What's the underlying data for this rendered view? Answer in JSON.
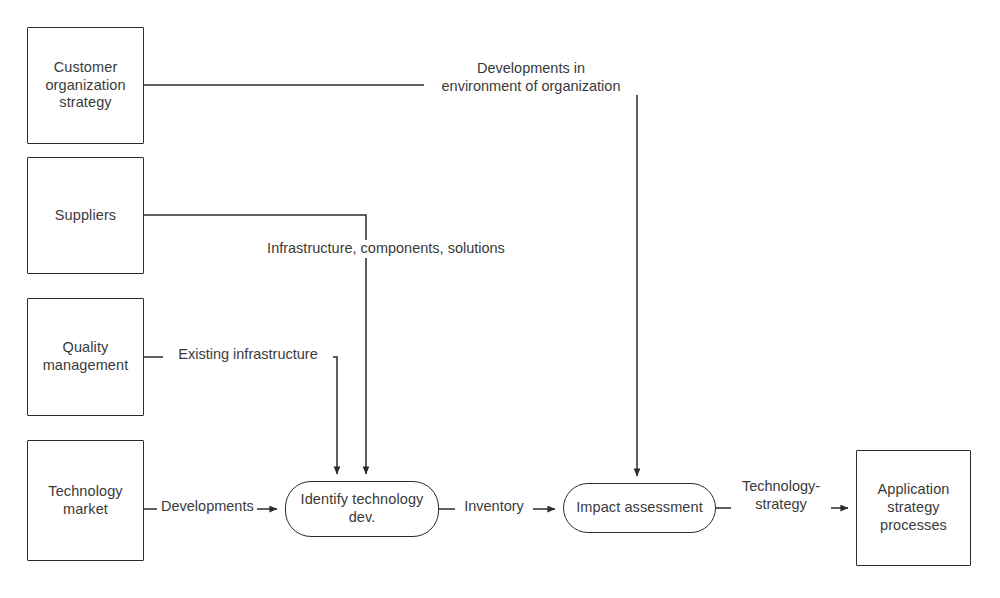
{
  "diagram": {
    "background_color": "#ffffff",
    "line_color": "#2b2b2b",
    "text_color": "#3a3a3a",
    "nodes": [
      {
        "id": "customer-organization-strategy",
        "label": "Customer\norganization\nstrategy",
        "shape": "rectangle"
      },
      {
        "id": "suppliers",
        "label": "Suppliers",
        "shape": "rectangle"
      },
      {
        "id": "quality-management",
        "label": "Quality\nmanagement",
        "shape": "rectangle"
      },
      {
        "id": "technology-market",
        "label": "Technology\nmarket",
        "shape": "rectangle"
      },
      {
        "id": "identify-technology-dev",
        "label": "Identify technology\ndev.",
        "shape": "rounded"
      },
      {
        "id": "impact-assessment",
        "label": "Impact assessment",
        "shape": "rounded"
      },
      {
        "id": "application-strategy-processes",
        "label": "Application\nstrategy\nprocesses",
        "shape": "rectangle"
      }
    ],
    "edge_labels": [
      {
        "id": "developments-in-environment",
        "text": "Developments in\nenvironment of organization"
      },
      {
        "id": "infrastructure-components",
        "text": "Infrastructure, components, solutions"
      },
      {
        "id": "existing-infrastructure",
        "text": "Existing infrastructure"
      },
      {
        "id": "developments",
        "text": "Developments"
      },
      {
        "id": "inventory",
        "text": "Inventory"
      },
      {
        "id": "technology-strategy",
        "text": "Technology-\nstrategy"
      }
    ],
    "edges": [
      {
        "from": "customer-organization-strategy",
        "to": "impact-assessment",
        "label": "Developments in environment of organization",
        "arrow": true
      },
      {
        "from": "suppliers",
        "to": "identify-technology-dev",
        "label": "Infrastructure, components, solutions",
        "arrow": true
      },
      {
        "from": "quality-management",
        "to": "identify-technology-dev",
        "label": "Existing infrastructure",
        "arrow": true
      },
      {
        "from": "technology-market",
        "to": "identify-technology-dev",
        "label": "Developments",
        "arrow": true
      },
      {
        "from": "identify-technology-dev",
        "to": "impact-assessment",
        "label": "Inventory",
        "arrow": true
      },
      {
        "from": "impact-assessment",
        "to": "application-strategy-processes",
        "label": "Technology-strategy",
        "arrow": true
      }
    ]
  }
}
